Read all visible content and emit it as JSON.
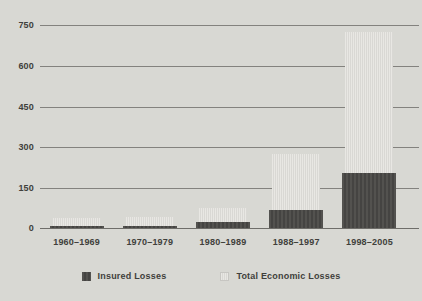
{
  "chart": {
    "y_axis": {
      "ticks": [
        "750",
        "600",
        "450",
        "300",
        "150",
        "0"
      ]
    },
    "legend": {
      "items": [
        {
          "label": "Insured Losses",
          "series": "insured",
          "swatch": "dark-gray-striped-swatch"
        },
        {
          "label": "Total Economic Losses",
          "series": "total",
          "swatch": "light-gray-striped-swatch"
        }
      ]
    },
    "colors": {
      "background": "#d8d8d3",
      "insured_bar": "#4c4b48",
      "total_bar": "#e1e0dc",
      "gridline": "#83827e",
      "axis_line": "#6e6d69",
      "text": "#403f3b"
    }
  },
  "chart_data": {
    "type": "bar",
    "categories": [
      "1960–1969",
      "1970–1979",
      "1980–1989",
      "1988–1997",
      "1998–2005"
    ],
    "series": [
      {
        "name": "Insured Losses",
        "values": [
          10,
          10,
          27,
          70,
          205
        ]
      },
      {
        "name": "Total Economic Losses",
        "values": [
          40,
          45,
          78,
          275,
          725
        ]
      }
    ],
    "title": "",
    "xlabel": "",
    "ylabel": "",
    "ylim": [
      0,
      750
    ],
    "ytick_step": 150,
    "grid": true,
    "legend_position": "bottom",
    "bar_style": "overlaid"
  }
}
